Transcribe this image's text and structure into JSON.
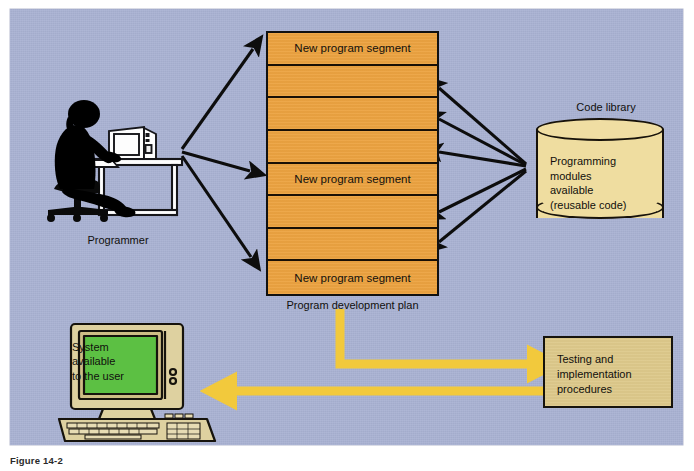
{
  "figure": {
    "caption": "Figure  14-2"
  },
  "canvas": {
    "background_color": "#a9b2d3",
    "width": 694,
    "height": 471
  },
  "colors": {
    "background": "#a9b2d3",
    "plan_orange": "#eca341",
    "library_yellow": "#efdda0",
    "testing_tan": "#ddc98b",
    "screen_green": "#5cc043",
    "computer_beige": "#ded1a0",
    "yellow_arrow": "#f2c93c",
    "outline_black": "#111111"
  },
  "programmer": {
    "label": "Programmer",
    "icon": "person-at-desk-silhouette"
  },
  "plan": {
    "caption": "Program development plan",
    "segment_count": 8,
    "segments": [
      {
        "index": 1,
        "label": "New program segment",
        "labeled": true
      },
      {
        "index": 2,
        "label": "",
        "labeled": false
      },
      {
        "index": 3,
        "label": "",
        "labeled": false
      },
      {
        "index": 4,
        "label": "",
        "labeled": false
      },
      {
        "index": 5,
        "label": "New program segment",
        "labeled": true
      },
      {
        "index": 6,
        "label": "",
        "labeled": false
      },
      {
        "index": 7,
        "label": "",
        "labeled": false
      },
      {
        "index": 8,
        "label": "New program segment",
        "labeled": true
      }
    ]
  },
  "library": {
    "title": "Code library",
    "body_lines": [
      "Programming",
      "modules",
      "available",
      "(reusable code)"
    ],
    "shape": "cylinder"
  },
  "testing": {
    "lines": [
      "Testing and",
      "implementation",
      "procedures"
    ]
  },
  "user_system": {
    "screen_lines": [
      "System",
      "available",
      "to the user"
    ],
    "icon": "desktop-computer"
  },
  "arrows": {
    "programmer_to_plan_count": 3,
    "library_to_plan_count": 5,
    "plan_to_testing": "yellow-elbow-arrow-right",
    "testing_to_user": "yellow-arrow-left"
  }
}
